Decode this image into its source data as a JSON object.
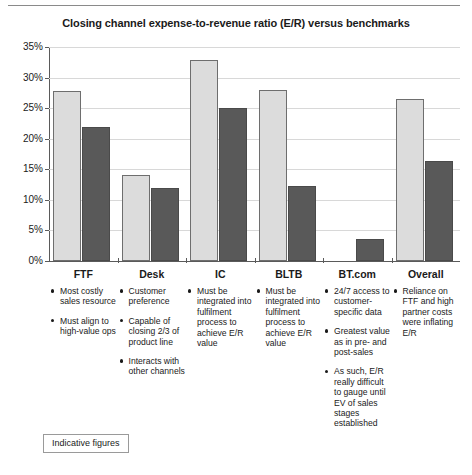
{
  "chart_data": {
    "type": "bar",
    "title": "Closing channel expense-to-revenue ratio (E/R) versus benchmarks",
    "xlabel": "",
    "ylabel": "",
    "ylim": [
      0,
      35
    ],
    "ytick_labels": [
      "35%",
      "30%",
      "25%",
      "20%",
      "15%",
      "10%",
      "5%",
      "0%"
    ],
    "ytick_values": [
      35,
      30,
      25,
      20,
      15,
      10,
      5,
      0
    ],
    "grid": true,
    "legend": "none",
    "categories": [
      "FTF",
      "Desk",
      "IC",
      "BLTB",
      "BT.com",
      "Overall"
    ],
    "series": [
      {
        "name": "Channel E/R",
        "color": "#dcdcdc",
        "values": [
          27.8,
          14.1,
          32.8,
          28.0,
          null,
          26.5
        ]
      },
      {
        "name": "Benchmark E/R",
        "color": "#595959",
        "values": [
          22.0,
          12.0,
          25.1,
          12.3,
          3.6,
          16.4
        ]
      }
    ]
  },
  "annotations": {
    "FTF": [
      "Most costly sales resource",
      "Must align to high-value ops"
    ],
    "Desk": [
      "Customer preference",
      "Capable of closing 2/3 of product line",
      "Interacts with other channels"
    ],
    "IC": [
      "Must be integrated into fulfilment process to achieve E/R value"
    ],
    "BLTB": [
      "Must be integrated into fulfilment process to achieve E/R value"
    ],
    "BT.com": [
      "24/7 access to customer-specific data",
      "Greatest value as in pre- and post-sales",
      "As such, E/R really difficult to gauge until EV of sales stages established"
    ],
    "Overall": [
      "Reliance on FTF and high partner costs were inflating E/R"
    ]
  },
  "footer": {
    "indicative_label": "Indicative figures"
  }
}
